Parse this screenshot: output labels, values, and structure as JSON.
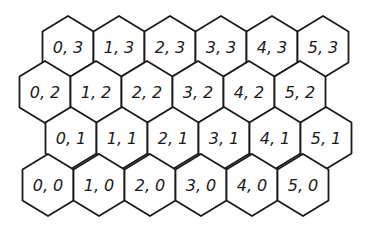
{
  "diagram": {
    "type": "hex-grid",
    "orientation": "pointy-top",
    "line_color": "#1a1a1a",
    "background": "#ffffff",
    "hex_width": 51,
    "hex_height": 62,
    "rows": [
      {
        "row": 3,
        "center_y": 47,
        "start_x": 68,
        "cells": [
          "0, 3",
          "1, 3",
          "2, 3",
          "3, 3",
          "4, 3",
          "5, 3"
        ]
      },
      {
        "row": 2,
        "center_y": 92,
        "start_x": 45,
        "cells": [
          "0, 2",
          "1, 2",
          "2, 2",
          "3, 2",
          "4, 2",
          "5, 2"
        ]
      },
      {
        "row": 1,
        "center_y": 138,
        "start_x": 71,
        "cells": [
          "0, 1",
          "1, 1",
          "2, 1",
          "3, 1",
          "4, 1",
          "5, 1"
        ]
      },
      {
        "row": 0,
        "center_y": 185,
        "start_x": 48,
        "cells": [
          "0, 0",
          "1, 0",
          "2, 0",
          "3, 0",
          "4, 0",
          "5, 0"
        ]
      }
    ],
    "col_spacing": 51
  }
}
